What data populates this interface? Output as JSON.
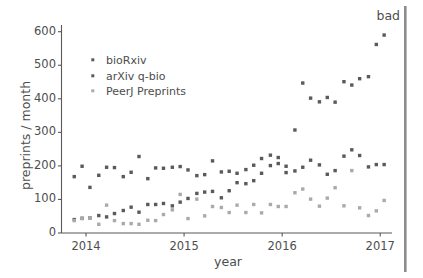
{
  "figure": {
    "background_color": "#ffffff",
    "annotation": {
      "text": "bad",
      "color": "#4d4d4d"
    },
    "divider_bar": {
      "name": "right-vertical-gray-bar",
      "color": "#8c8c8c"
    }
  },
  "chart_data": {
    "type": "scatter",
    "title": "",
    "xlabel": "year",
    "ylabel": "preprints / month",
    "xlim": [
      2013.75,
      2017.12
    ],
    "ylim": [
      0,
      620
    ],
    "xticks": [
      2014,
      2015,
      2016,
      2017
    ],
    "xtick_labels": [
      "2014",
      "2015",
      "2016",
      "2017"
    ],
    "yticks": [
      0,
      100,
      200,
      300,
      400,
      500,
      600
    ],
    "ytick_labels": [
      "0",
      "100",
      "200",
      "300",
      "400",
      "500",
      "600"
    ],
    "grid": false,
    "legend_position": "upper left",
    "colors": {
      "bioRxiv": "#5a5a5a",
      "arXiv q-bio": "#5a5a5a",
      "PeerJ Preprints": "#aaaaaa"
    },
    "series": [
      {
        "name": "bioRxiv",
        "color": "#5a5a5a",
        "marker": "square",
        "x": [
          2013.88,
          2013.96,
          2014.04,
          2014.13,
          2014.21,
          2014.29,
          2014.38,
          2014.46,
          2014.54,
          2014.63,
          2014.71,
          2014.79,
          2014.88,
          2014.96,
          2015.04,
          2015.13,
          2015.21,
          2015.29,
          2015.38,
          2015.46,
          2015.54,
          2015.63,
          2015.71,
          2015.79,
          2015.88,
          2015.96,
          2016.04,
          2016.13,
          2016.21,
          2016.29,
          2016.38,
          2016.46,
          2016.54,
          2016.63,
          2016.71,
          2016.79,
          2016.88,
          2016.96,
          2017.04
        ],
        "y": [
          40,
          44,
          45,
          52,
          48,
          58,
          67,
          77,
          62,
          85,
          85,
          88,
          81,
          92,
          103,
          118,
          122,
          124,
          105,
          126,
          150,
          147,
          156,
          178,
          201,
          207,
          199,
          307,
          447,
          402,
          391,
          404,
          390,
          451,
          441,
          460,
          466,
          562,
          590
        ]
      },
      {
        "name": "arXiv q-bio",
        "color": "#5a5a5a",
        "marker": "square",
        "x": [
          2013.88,
          2013.96,
          2014.04,
          2014.13,
          2014.21,
          2014.29,
          2014.38,
          2014.46,
          2014.54,
          2014.63,
          2014.71,
          2014.79,
          2014.88,
          2014.96,
          2015.04,
          2015.13,
          2015.21,
          2015.29,
          2015.38,
          2015.46,
          2015.54,
          2015.63,
          2015.71,
          2015.79,
          2015.88,
          2015.96,
          2016.04,
          2016.13,
          2016.21,
          2016.29,
          2016.38,
          2016.46,
          2016.54,
          2016.63,
          2016.71,
          2016.79,
          2016.88,
          2016.96,
          2017.04
        ],
        "y": [
          168,
          199,
          136,
          172,
          196,
          195,
          168,
          181,
          228,
          162,
          194,
          193,
          196,
          198,
          188,
          171,
          174,
          215,
          182,
          184,
          178,
          189,
          202,
          222,
          232,
          225,
          180,
          185,
          196,
          217,
          203,
          175,
          186,
          229,
          248,
          231,
          197,
          204,
          204
        ]
      },
      {
        "name": "PeerJ Preprints",
        "color": "#aaaaaa",
        "marker": "square",
        "x": [
          2013.88,
          2013.96,
          2014.04,
          2014.13,
          2014.21,
          2014.29,
          2014.38,
          2014.46,
          2014.54,
          2014.63,
          2014.71,
          2014.79,
          2014.88,
          2014.96,
          2015.04,
          2015.13,
          2015.21,
          2015.29,
          2015.38,
          2015.46,
          2015.54,
          2015.63,
          2015.71,
          2015.79,
          2015.88,
          2015.96,
          2016.04,
          2016.13,
          2016.21,
          2016.29,
          2016.38,
          2016.46,
          2016.54,
          2016.63,
          2016.71,
          2016.79,
          2016.88,
          2016.96,
          2017.04
        ],
        "y": [
          37,
          43,
          45,
          26,
          83,
          37,
          28,
          28,
          26,
          38,
          37,
          55,
          69,
          115,
          43,
          101,
          51,
          79,
          76,
          61,
          83,
          61,
          85,
          60,
          85,
          79,
          79,
          120,
          131,
          101,
          80,
          104,
          135,
          81,
          186,
          75,
          52,
          66,
          97
        ]
      }
    ]
  },
  "legend": {
    "entries": [
      {
        "label": "bioRxiv",
        "color": "#5a5a5a"
      },
      {
        "label": "arXiv q-bio",
        "color": "#5a5a5a"
      },
      {
        "label": "PeerJ Preprints",
        "color": "#aaaaaa"
      }
    ]
  }
}
